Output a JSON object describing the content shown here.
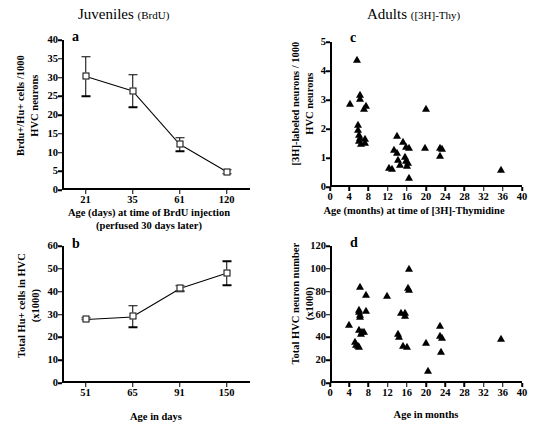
{
  "figure": {
    "group_titles": [
      {
        "id": "title-juv",
        "main": "Juveniles",
        "sub": "(BrdU)"
      },
      {
        "id": "title-ad",
        "main": "Adults",
        "sub": "([3H]-Thy)"
      }
    ]
  },
  "panels": {
    "a": {
      "letter": "a",
      "ylabel": "Brdu+/Hu+ cells /1000 HVC neurons",
      "ylabel_line1": "Brdu+/Hu+ cells /1000",
      "ylabel_line2": "HVC neurons",
      "xlabel_line1": "Age (days) at time of BrdU injection",
      "xlabel_line2": "(perfused 30 days later)",
      "yticks": [
        "0",
        "5",
        "10",
        "15",
        "20",
        "25",
        "30",
        "35",
        "40"
      ],
      "xticks": [
        "21",
        "35",
        "61",
        "120"
      ]
    },
    "b": {
      "letter": "b",
      "ylabel_line1": "Total Hu+ cells in HVC",
      "ylabel_line2": "(x1000)",
      "xlabel_line1": "Age in days",
      "yticks": [
        "0",
        "10",
        "20",
        "30",
        "40",
        "50",
        "60"
      ],
      "xticks": [
        "51",
        "65",
        "91",
        "150"
      ]
    },
    "c": {
      "letter": "c",
      "ylabel_line1": "[3H]-labeled neurons / 1000",
      "ylabel_line2": "HVC neurons",
      "xlabel_line1": "Age (months) at time of [3H]-Thymidine",
      "yticks": [
        "0",
        "1",
        "2",
        "3",
        "4",
        "5"
      ],
      "xticks": [
        "0",
        "4",
        "8",
        "12",
        "16",
        "20",
        "24",
        "28",
        "32",
        "36",
        "40"
      ]
    },
    "d": {
      "letter": "d",
      "ylabel_line1": "Total HVC neuron number",
      "ylabel_line2": "(x1000)",
      "xlabel_line1": "Age in months",
      "yticks": [
        "0",
        "20",
        "40",
        "60",
        "80",
        "100",
        "120"
      ],
      "xticks": [
        "0",
        "4",
        "8",
        "12",
        "16",
        "20",
        "24",
        "28",
        "32",
        "36",
        "40"
      ]
    }
  },
  "chart_data": [
    {
      "panel": "a",
      "type": "line",
      "title": "Juveniles (BrdU)",
      "xlabel": "Age (days) at time of BrdU injection (perfused 30 days later)",
      "ylabel": "Brdu+/Hu+ cells /1000 HVC neurons",
      "categories": [
        "21",
        "35",
        "61",
        "120"
      ],
      "values": [
        30.3,
        26.4,
        12.2,
        4.9
      ],
      "errors": [
        5.3,
        4.3,
        1.8,
        0.5
      ],
      "ylim": [
        0,
        40
      ],
      "ytick_step": 5,
      "grid": false,
      "marker": "open-square",
      "error_bars": true
    },
    {
      "panel": "b",
      "type": "line",
      "title": "",
      "xlabel": "Age in days",
      "ylabel": "Total Hu+ cells in HVC (x1000)",
      "categories": [
        "51",
        "65",
        "91",
        "150"
      ],
      "values": [
        28.1,
        29.2,
        41.4,
        48.1
      ],
      "errors": [
        0.4,
        4.7,
        1.3,
        5.3
      ],
      "ylim": [
        0,
        60
      ],
      "ytick_step": 10,
      "grid": false,
      "marker": "open-square",
      "error_bars": true
    },
    {
      "panel": "c",
      "type": "scatter",
      "title": "Adults ([3H]-Thy)",
      "xlabel": "Age (months) at time of [3H]-Thymidine",
      "ylabel": "[3H]-labeled neurons / 1000 HVC neurons",
      "xlim": [
        0,
        40
      ],
      "ylim": [
        0,
        5
      ],
      "xtick_step": 4,
      "ytick_step": 1,
      "grid": false,
      "marker": "filled-triangle",
      "points": [
        [
          5.6,
          4.38
        ],
        [
          4.2,
          2.86
        ],
        [
          6.2,
          3.18
        ],
        [
          6.2,
          3.02
        ],
        [
          7.4,
          2.78
        ],
        [
          7.0,
          2.68
        ],
        [
          20.0,
          2.7
        ],
        [
          5.9,
          2.13
        ],
        [
          5.9,
          1.96
        ],
        [
          6.0,
          1.8
        ],
        [
          6.2,
          1.7
        ],
        [
          6.1,
          1.57
        ],
        [
          6.5,
          1.48
        ],
        [
          7.3,
          1.66
        ],
        [
          7.3,
          1.52
        ],
        [
          14.0,
          1.75
        ],
        [
          15.2,
          1.55
        ],
        [
          13.3,
          1.28
        ],
        [
          14.0,
          1.18
        ],
        [
          15.8,
          1.38
        ],
        [
          16.4,
          1.36
        ],
        [
          19.8,
          1.36
        ],
        [
          23.0,
          1.34
        ],
        [
          23.4,
          1.3
        ],
        [
          23.0,
          1.06
        ],
        [
          14.2,
          0.92
        ],
        [
          15.6,
          1.02
        ],
        [
          15.8,
          0.88
        ],
        [
          16.2,
          0.82
        ],
        [
          14.6,
          0.76
        ],
        [
          16.0,
          0.72
        ],
        [
          12.2,
          0.66
        ],
        [
          13.0,
          0.62
        ],
        [
          16.4,
          0.3
        ],
        [
          35.6,
          0.6
        ]
      ]
    },
    {
      "panel": "d",
      "type": "scatter",
      "title": "",
      "xlabel": "Age in months",
      "ylabel": "Total HVC neuron number (x1000)",
      "xlim": [
        0,
        40
      ],
      "ylim": [
        0,
        120
      ],
      "xtick_step": 4,
      "ytick_step": 20,
      "grid": false,
      "marker": "filled-triangle",
      "points": [
        [
          16.4,
          99.5
        ],
        [
          6.3,
          84.5
        ],
        [
          7.4,
          77.0
        ],
        [
          11.8,
          76.0
        ],
        [
          16.2,
          83.5
        ],
        [
          16.4,
          81.5
        ],
        [
          6.0,
          64.0
        ],
        [
          6.1,
          62.0
        ],
        [
          6.2,
          60.0
        ],
        [
          6.2,
          57.5
        ],
        [
          7.6,
          63.5
        ],
        [
          14.8,
          61.5
        ],
        [
          15.6,
          61.0
        ],
        [
          15.6,
          58.5
        ],
        [
          4.0,
          50.5
        ],
        [
          6.1,
          46.5
        ],
        [
          6.6,
          45.0
        ],
        [
          7.0,
          44.5
        ],
        [
          6.4,
          43.0
        ],
        [
          14.2,
          42.5
        ],
        [
          14.4,
          40.0
        ],
        [
          23.0,
          49.5
        ],
        [
          23.0,
          41.0
        ],
        [
          23.4,
          39.5
        ],
        [
          20.0,
          35.0
        ],
        [
          35.6,
          38.5
        ],
        [
          5.2,
          35.5
        ],
        [
          5.4,
          33.0
        ],
        [
          5.8,
          32.0
        ],
        [
          6.0,
          31.5
        ],
        [
          15.2,
          32.5
        ],
        [
          16.0,
          31.5
        ],
        [
          23.2,
          27.5
        ],
        [
          20.4,
          10.5
        ]
      ]
    }
  ]
}
